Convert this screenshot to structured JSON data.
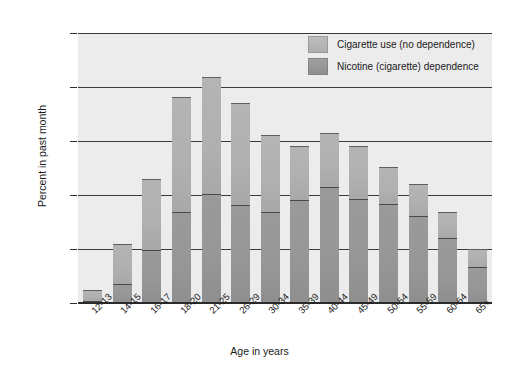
{
  "chart_data": {
    "type": "bar",
    "subtype": "stacked-bar",
    "title": "",
    "xlabel": "Age in years",
    "ylabel": "Percent in past month",
    "ylim": [
      0,
      50
    ],
    "yticks": [
      "0.0",
      "10.0",
      "20.0",
      "30.0",
      "40.0",
      "50.0"
    ],
    "grid": true,
    "legend_position": "top-right",
    "categories": [
      "12-13",
      "14-15",
      "16-17",
      "18-20",
      "21-25",
      "26-29",
      "30-34",
      "35-39",
      "40-44",
      "45-49",
      "50-54",
      "55-59",
      "60-64",
      "65+"
    ],
    "series": [
      {
        "name": "Nicotine (cigarette) dependence",
        "color": "#979797",
        "values": [
          0.4,
          3.6,
          9.8,
          16.8,
          20.2,
          18.1,
          16.8,
          19.1,
          21.4,
          19.3,
          18.4,
          16.1,
          12.1,
          6.6
        ]
      },
      {
        "name": "Cigarette use (no dependence)",
        "color": "#b0b0b0",
        "values": [
          2.1,
          7.4,
          13.2,
          21.4,
          21.6,
          19.0,
          14.4,
          9.9,
          10.0,
          9.8,
          6.8,
          5.9,
          4.8,
          3.4
        ]
      }
    ],
    "totals": [
      2.5,
      11.0,
      23.0,
      38.2,
      41.8,
      37.1,
      31.2,
      29.0,
      31.4,
      29.1,
      25.2,
      22.0,
      16.9,
      10.0
    ]
  },
  "legend": {
    "items": [
      {
        "label": "Cigarette use (no dependence)"
      },
      {
        "label": "Nicotine (cigarette) dependence"
      }
    ]
  }
}
